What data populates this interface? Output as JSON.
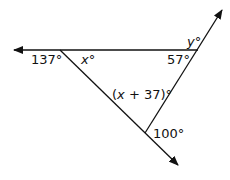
{
  "diagram": {
    "type": "triangle-angles",
    "lines": [
      {
        "id": "horizontal-line",
        "from": [
          198,
          50
        ],
        "to": [
          14,
          50
        ],
        "arrow": "end"
      },
      {
        "id": "diagonal-left-line",
        "from": [
          60,
          50
        ],
        "to": [
          178,
          165
        ],
        "arrow": "end"
      },
      {
        "id": "diagonal-right-line",
        "from": [
          145,
          133
        ],
        "to": [
          222,
          10
        ],
        "arrow": "end"
      }
    ],
    "labels": {
      "exterior_left": "137°",
      "interior_left_var": "x",
      "interior_left_deg": "°",
      "interior_right": "57°",
      "exterior_top_var": "y",
      "exterior_top_deg": "°",
      "interior_bottom_open": "(",
      "interior_bottom_var": "x",
      "interior_bottom_rest": " + 37)°",
      "exterior_bottom": "100°"
    },
    "colors": {
      "stroke": "#111111",
      "background": "#ffffff"
    }
  }
}
